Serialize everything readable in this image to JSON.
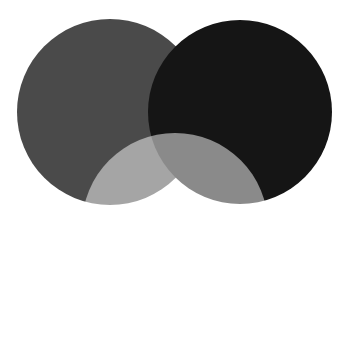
{
  "figure": {
    "type": "venn-diagram",
    "width": 351,
    "height": 337,
    "background_color": "#ffffff",
    "frame_color": "#c9c9c9",
    "set_count": 3,
    "title": "",
    "caption": ""
  },
  "chart_data": {
    "type": "venn",
    "title": "",
    "subtitle": "",
    "xlabel": "",
    "ylabel": "",
    "legend_position": "none",
    "grid": false,
    "background": "#ffffff",
    "sets": [
      {
        "id": "set-left",
        "label": "",
        "cx": 110,
        "cy": 112,
        "r": 93,
        "fill": "#4a4a4a",
        "opacity": 1,
        "blend": "normal",
        "z": 1
      },
      {
        "id": "set-right",
        "label": "",
        "cx": 240,
        "cy": 112,
        "r": 92,
        "fill": "#151515",
        "opacity": 1,
        "blend": "normal",
        "z": 2
      },
      {
        "id": "set-bottom",
        "label": "",
        "cx": 175,
        "cy": 226,
        "r": 93,
        "fill": "#808080",
        "opacity": 1,
        "blend": "screen",
        "z": 3
      }
    ],
    "regions": [
      {
        "id": "left-only",
        "label": "",
        "color": "#4a4a4a"
      },
      {
        "id": "right-only",
        "label": "",
        "color": "#151515"
      },
      {
        "id": "bottom-only",
        "label": "",
        "color": "#808080"
      },
      {
        "id": "left-and-right",
        "label": "",
        "color": "#121212"
      },
      {
        "id": "left-and-bottom",
        "label": "",
        "color": "#eeeeee"
      },
      {
        "id": "right-and-bottom",
        "label": "",
        "color": "#999999"
      },
      {
        "id": "all-three",
        "label": "",
        "color": "#fbfbfb"
      }
    ]
  }
}
